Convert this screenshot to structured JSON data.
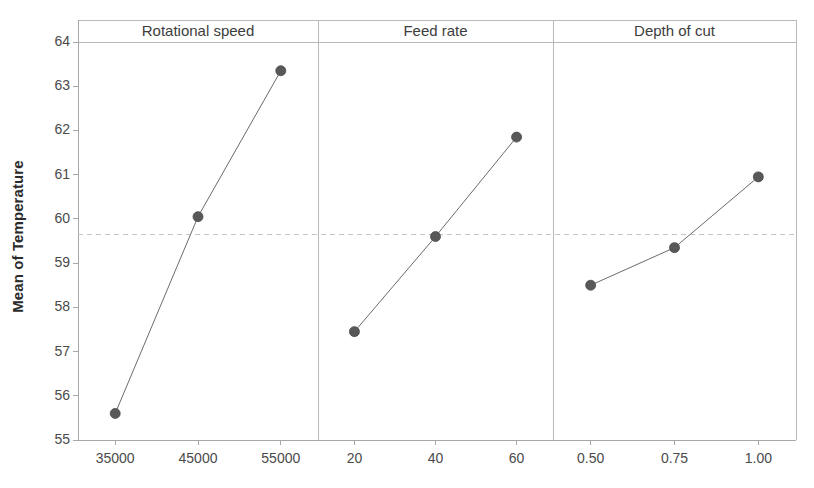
{
  "chart_data": {
    "type": "line",
    "title": "",
    "subtitle": "",
    "ylabel": "Mean of Temperature",
    "xlabel": "",
    "ylim": [
      55,
      64
    ],
    "yticks": [
      "55",
      "56",
      "57",
      "58",
      "59",
      "60",
      "61",
      "62",
      "63",
      "64"
    ],
    "grid": false,
    "legend": "none",
    "reference_line": 59.65,
    "marker_color": "#585858",
    "line_color": "#6b6b6b",
    "panels": [
      {
        "name": "Rotational speed",
        "categories": [
          "35000",
          "45000",
          "55000"
        ],
        "values": [
          55.6,
          60.05,
          63.35
        ]
      },
      {
        "name": "Feed rate",
        "categories": [
          "20",
          "40",
          "60"
        ],
        "values": [
          57.45,
          59.6,
          61.85
        ]
      },
      {
        "name": "Depth of cut",
        "categories": [
          "0.50",
          "0.75",
          "1.00"
        ],
        "values": [
          58.5,
          59.35,
          60.95
        ]
      }
    ]
  }
}
